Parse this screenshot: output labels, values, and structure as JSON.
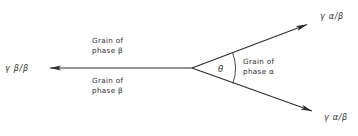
{
  "figure": {
    "type": "diagram",
    "background_color": "#ffffff",
    "line_color": "#2b2b2b",
    "text_color": "#2b2b2b"
  },
  "labels": {
    "beta_beta_tension": "γ β/β",
    "alpha_beta_tension_top": "γ α/β",
    "alpha_beta_tension_bottom": "γ α/β",
    "grain_beta_upper_line1": "Grain of",
    "grain_beta_upper_line2": "phase β",
    "grain_beta_lower_line1": "Grain of",
    "grain_beta_lower_line2": "phase β",
    "grain_alpha_line1": "Grain of",
    "grain_alpha_line2": "phase α",
    "angle_symbol": "θ"
  },
  "geometry": {
    "junction_point": {
      "x": 192,
      "y": 68
    },
    "beta_boundary_arrow_tip": {
      "x": 43,
      "y": 68
    },
    "alpha_upper_arrow_tip": {
      "x": 314,
      "y": 21
    },
    "alpha_lower_arrow_tip": {
      "x": 319,
      "y": 114
    },
    "dihedral_angle_arc_radius": 43
  }
}
